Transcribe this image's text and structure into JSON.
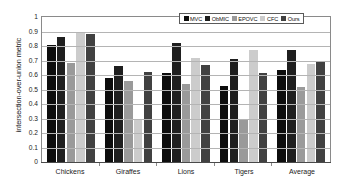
{
  "chart_data": {
    "type": "bar",
    "title": "",
    "xlabel": "",
    "ylabel": "intersection-over-union metric",
    "ylim": [
      0,
      1
    ],
    "ytick_labels": [
      "1",
      "0.9",
      "0.8",
      "0.7",
      "0.6",
      "0.5",
      "0.4",
      "0.3",
      "0.2",
      "0.1",
      "0"
    ],
    "ytick_values": [
      1,
      0.9,
      0.8,
      0.7,
      0.6,
      0.5,
      0.4,
      0.3,
      0.2,
      0.1,
      0
    ],
    "grid": true,
    "legend_position": "top-right",
    "categories": [
      "Chickens",
      "Giraffes",
      "Lions",
      "Tigers",
      "Average"
    ],
    "series": [
      {
        "name": "MVC",
        "color": "#0d0d0d",
        "values": [
          0.81,
          0.58,
          0.615,
          0.525,
          0.633
        ]
      },
      {
        "name": "ObMIC",
        "color": "#1f1f1f",
        "values": [
          0.865,
          0.665,
          0.82,
          0.71,
          0.77
        ]
      },
      {
        "name": "EPOVC",
        "color": "#9a9a9a",
        "values": [
          0.68,
          0.56,
          0.535,
          0.295,
          0.515
        ]
      },
      {
        "name": "CFC",
        "color": "#cccccc",
        "values": [
          0.9,
          0.3,
          0.715,
          0.775,
          0.675
        ]
      },
      {
        "name": "Ours",
        "color": "#414141",
        "values": [
          0.885,
          0.62,
          0.67,
          0.615,
          0.695
        ]
      }
    ]
  }
}
